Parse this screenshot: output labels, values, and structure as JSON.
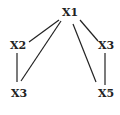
{
  "diagram": {
    "type": "tree-graph",
    "nodes": [
      {
        "id": "n1",
        "label": "X1",
        "x": 70,
        "y": 13
      },
      {
        "id": "n2",
        "label": "X2",
        "x": 18,
        "y": 46
      },
      {
        "id": "n3",
        "label": "X3",
        "x": 106,
        "y": 46
      },
      {
        "id": "n4",
        "label": "X3",
        "x": 19,
        "y": 94
      },
      {
        "id": "n5",
        "label": "X5",
        "x": 106,
        "y": 94
      }
    ],
    "edges": [
      {
        "from": "X1",
        "to": "X2"
      },
      {
        "from": "X1",
        "to": "X3 (bottom-left)"
      },
      {
        "from": "X2",
        "to": "X3 (bottom-left)"
      },
      {
        "from": "X1",
        "to": "X3 (right)"
      },
      {
        "from": "X1",
        "to": "X5"
      },
      {
        "from": "X3 (right)",
        "to": "X5"
      }
    ],
    "line_color": "#222222"
  }
}
